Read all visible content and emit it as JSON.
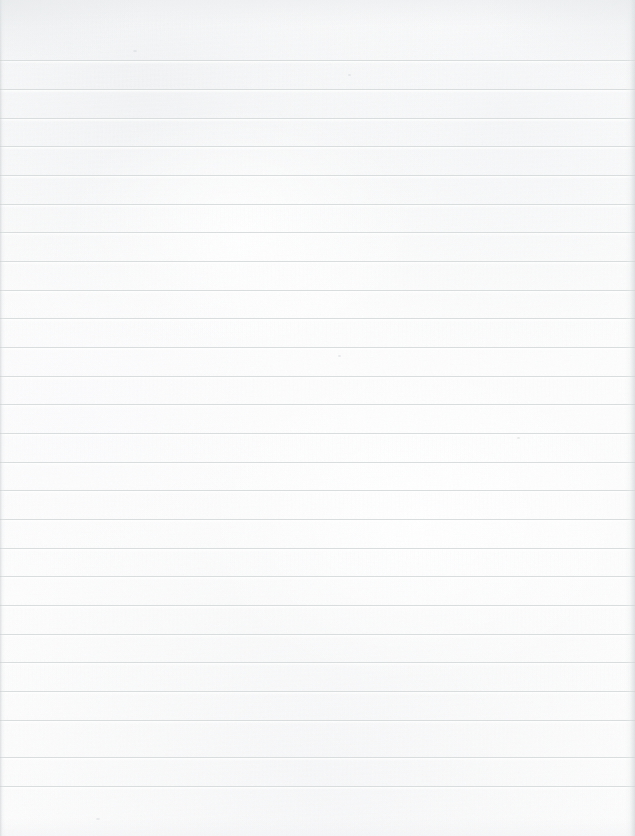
{
  "document": {
    "kind": "ruled-notebook-paper-scan",
    "title": "Blank ruled paper",
    "width_px": 635,
    "height_px": 836,
    "orientation": "portrait",
    "content_text": "",
    "is_blank": true,
    "has_handwriting": false,
    "has_printed_text": false,
    "has_vertical_margin_rule": false
  },
  "paper": {
    "background_color": "#fcfcfc",
    "highlight_color": "#ffffff",
    "tone_shadow_color": "#ecedef",
    "edge_shadow_color": "#d1d5d7",
    "texture": "fine scanned paper grain with soft tonal mottling"
  },
  "ruling": {
    "style": "horizontal ruled lines only",
    "line_color": "#d9dddd",
    "line_thickness_px": 1,
    "line_spacing_px": 29,
    "first_line_y_px": 60,
    "last_line_y_px": 786,
    "line_count": 26,
    "top_margin_px": 60,
    "bottom_margin_px": 50,
    "left_inset_px": 0,
    "right_inset_px": 0,
    "line_y_positions": [
      60,
      89,
      118,
      146,
      175,
      204,
      232,
      261,
      290,
      318,
      347,
      376,
      404,
      433,
      462,
      490,
      519,
      548,
      576,
      605,
      634,
      662,
      691,
      720,
      757,
      786
    ]
  },
  "edges": {
    "left_shadow": true,
    "right_shadow": true,
    "top_shadow": true,
    "bottom_shadow": true
  },
  "specks": [
    {
      "x": 348,
      "y": 74,
      "w": 3,
      "h": 2
    },
    {
      "x": 133,
      "y": 50,
      "w": 4,
      "h": 2
    },
    {
      "x": 517,
      "y": 437,
      "w": 3,
      "h": 2
    },
    {
      "x": 96,
      "y": 818,
      "w": 4,
      "h": 2
    },
    {
      "x": 338,
      "y": 355,
      "w": 3,
      "h": 2
    }
  ]
}
